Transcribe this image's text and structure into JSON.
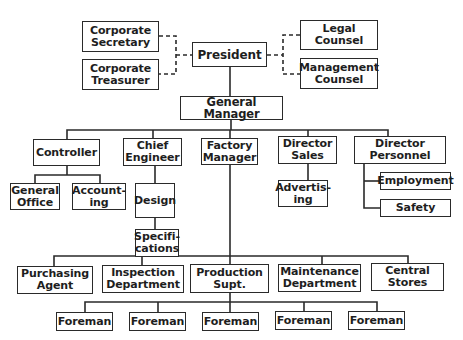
{
  "diagram": {
    "type": "organization-chart",
    "top": {
      "president": "President",
      "staff_left": [
        "Corporate\nSecretary",
        "Corporate\nTreasurer"
      ],
      "staff_right": [
        "Legal\nCounsel",
        "Management\nCounsel"
      ],
      "general_manager": "General Manager"
    },
    "departments": [
      {
        "label": "Controller",
        "children": [
          "General\nOffice",
          "Account-\ning"
        ]
      },
      {
        "label": "Chief\nEngineer",
        "children": [
          "Design",
          "Specifi-\ncations"
        ]
      },
      {
        "label": "Factory\nManager",
        "children": [
          "Purchasing\nAgent",
          "Inspection\nDepartment",
          "Production\nSupt.",
          "Maintenance\nDepartment",
          "Central\nStores"
        ]
      },
      {
        "label": "Director\nSales",
        "children": [
          "Advertis-\ning"
        ]
      },
      {
        "label": "Director\nPersonnel",
        "children": [
          "Employment",
          "Safety"
        ]
      }
    ],
    "production_foremen": [
      "Foreman",
      "Foreman",
      "Foreman",
      "Foreman",
      "Foreman"
    ],
    "colors": {
      "line": "#2a2a2a",
      "text": "#1e1e1e",
      "background": "#ffffff"
    }
  }
}
